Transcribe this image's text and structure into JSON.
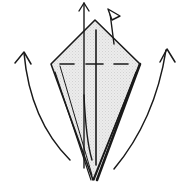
{
  "diagram": {
    "title": "Origami kite base fold step",
    "colors": {
      "line": "#1a1a1a",
      "paper_fill": "#e6e6e6",
      "background": "#ffffff"
    },
    "elements": {
      "kite": "kite-shaped paper",
      "valley_fold": "dashed horizontal valley fold line",
      "center_crease": "vertical center crease",
      "left_arrow": "curved fold-up arrow left",
      "right_arrow": "curved fold-up arrow right",
      "center_arrow": "straight up arrow",
      "flag_arrow": "flag-shaped push/open marker"
    }
  }
}
